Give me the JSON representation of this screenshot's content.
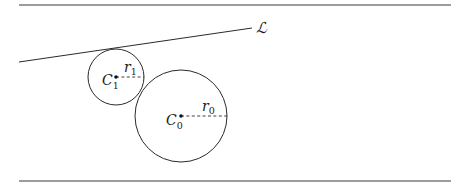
{
  "figure": {
    "top_rule": {
      "x1": 19,
      "y1": 5,
      "x2": 451,
      "y2": 5
    },
    "bottom_rule": {
      "x1": 19,
      "y1": 181,
      "x2": 451,
      "y2": 181
    },
    "line_L": {
      "label": "ℒ",
      "x1": 19,
      "y1": 62,
      "x2": 252,
      "y2": 28,
      "label_x": 256,
      "label_y": 33
    },
    "circle_1": {
      "center_label": "C",
      "center_subscript": "1",
      "radius_label": "r",
      "radius_subscript": "1",
      "cx": 116,
      "cy": 77,
      "r": 28
    },
    "circle_0": {
      "center_label": "C",
      "center_subscript": "0",
      "radius_label": "r",
      "radius_subscript": "0",
      "cx": 181,
      "cy": 116,
      "r": 46
    }
  }
}
